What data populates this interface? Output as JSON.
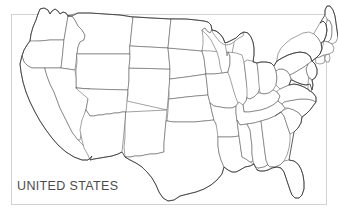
{
  "map": {
    "label": "UNITED STATES",
    "title": "UNITED STATES",
    "region": "Contiguous United States",
    "projection_note": "outline map with state boundaries",
    "colors": {
      "background": "#ffffff",
      "frame_border": "#d2d2d2",
      "state_border": "#555555",
      "national_outline": "#333333",
      "label_text": "#4c4c4c"
    },
    "states": [
      "Washington",
      "Oregon",
      "California",
      "Nevada",
      "Idaho",
      "Montana",
      "Wyoming",
      "Utah",
      "Arizona",
      "Colorado",
      "New Mexico",
      "North Dakota",
      "South Dakota",
      "Nebraska",
      "Kansas",
      "Oklahoma",
      "Texas",
      "Minnesota",
      "Iowa",
      "Missouri",
      "Arkansas",
      "Louisiana",
      "Wisconsin",
      "Illinois",
      "Michigan",
      "Indiana",
      "Ohio",
      "Kentucky",
      "Tennessee",
      "Mississippi",
      "Alabama",
      "Georgia",
      "Florida",
      "South Carolina",
      "North Carolina",
      "Virginia",
      "West Virginia",
      "Maryland",
      "Delaware",
      "Pennsylvania",
      "New Jersey",
      "New York",
      "Connecticut",
      "Rhode Island",
      "Massachusetts",
      "Vermont",
      "New Hampshire",
      "Maine"
    ],
    "state_count": 48
  }
}
